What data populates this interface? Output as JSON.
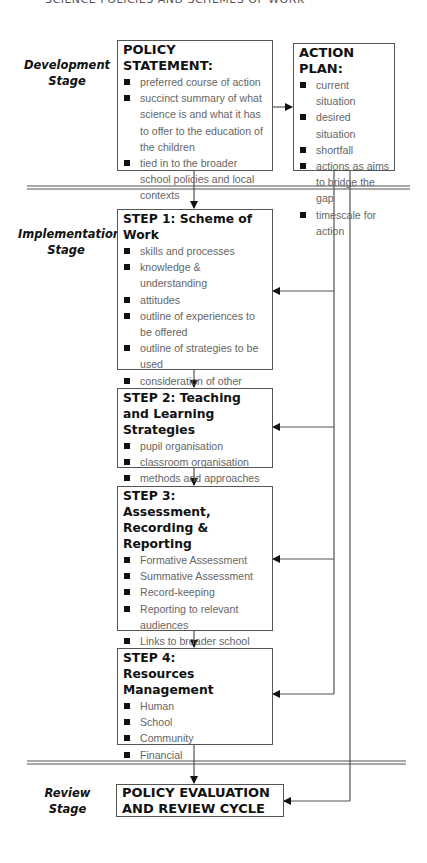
{
  "running_header": "SCIENCE POLICIES AND SCHEMES OF WORK",
  "stages": {
    "development": [
      "Development",
      "Stage"
    ],
    "implementation": [
      "Implementation",
      "Stage"
    ],
    "review": [
      "Review",
      "Stage"
    ]
  },
  "policy_statement": {
    "title": "POLICY STATEMENT:",
    "items": [
      "preferred course of action",
      "succinct summary of what science is and what it has to offer to the education of the children",
      "tied in to the broader school policies and local contexts"
    ]
  },
  "action_plan": {
    "title": "ACTION PLAN:",
    "items": [
      "current situation",
      "desired situation",
      "shortfall",
      "actions as aims to bridge the gap",
      "timescale for action"
    ]
  },
  "steps": [
    {
      "title": "STEP 1: Scheme of Work",
      "items": [
        "skills and processes",
        "knowledge & understanding",
        "attitudes",
        "outline of experiences to be offered",
        "outline of strategies to be used",
        "consideration of other factors"
      ]
    },
    {
      "title": "STEP 2: Teaching and Learning Strategies",
      "items": [
        "pupil organisation",
        "classroom organisation",
        "methods and approaches"
      ]
    },
    {
      "title": "STEP 3: Assessment, Recording & Reporting",
      "items": [
        "Formative Assessment",
        "Summative Assessment",
        "Record-keeping",
        "Reporting to relevant audiences",
        "Links to broader school policies"
      ]
    },
    {
      "title": "STEP 4: Resources Management",
      "items": [
        "Human",
        "School",
        "Community",
        "Financial"
      ]
    }
  ],
  "review_box": {
    "title": "POLICY EVALUATION AND REVIEW CYCLE"
  },
  "colors": {
    "line": "#555555",
    "text": "#111111",
    "item_text": "#666666"
  }
}
